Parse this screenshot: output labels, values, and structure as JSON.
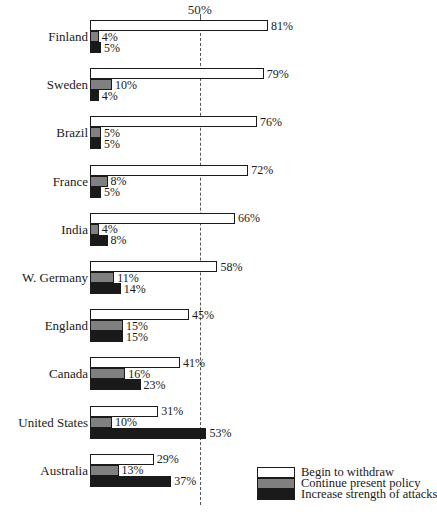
{
  "chart_data": {
    "type": "bar",
    "title": "",
    "xlabel": "",
    "ylabel": "",
    "orientation": "horizontal",
    "grid": false,
    "xlim": [
      0,
      100
    ],
    "axis_marker": {
      "label": "50%",
      "value": 50
    },
    "legend_position": "bottom-right",
    "categories": [
      "Finland",
      "Sweden",
      "Brazil",
      "France",
      "India",
      "W. Germany",
      "England",
      "Canada",
      "United States",
      "Australia"
    ],
    "series": [
      {
        "name": "Begin to withdraw",
        "color": "#ffffff",
        "values": [
          81,
          79,
          76,
          72,
          66,
          58,
          45,
          41,
          31,
          29
        ],
        "labels": [
          "81%",
          "79%",
          "76%",
          "72%",
          "66%",
          "58%",
          "45%",
          "41%",
          "31%",
          "29%"
        ]
      },
      {
        "name": "Continue present policy",
        "color": "#808080",
        "values": [
          4,
          10,
          5,
          8,
          4,
          11,
          15,
          16,
          10,
          13
        ],
        "labels": [
          "4%",
          "10%",
          "5%",
          "8%",
          "4%",
          "11%",
          "15%",
          "16%",
          "10%",
          "13%"
        ]
      },
      {
        "name": "Increase strength of attacks",
        "color": "#1a1a1a",
        "values": [
          5,
          4,
          5,
          5,
          8,
          14,
          15,
          23,
          53,
          37
        ],
        "labels": [
          "5%",
          "4%",
          "5%",
          "5%",
          "8%",
          "14%",
          "15%",
          "23%",
          "53%",
          "37%"
        ]
      }
    ]
  },
  "legend": {
    "items": [
      {
        "label": "Begin to withdraw",
        "color": "#ffffff"
      },
      {
        "label": "Continue present policy",
        "color": "#808080"
      },
      {
        "label": "Increase strength of attacks",
        "color": "#1a1a1a"
      }
    ]
  }
}
